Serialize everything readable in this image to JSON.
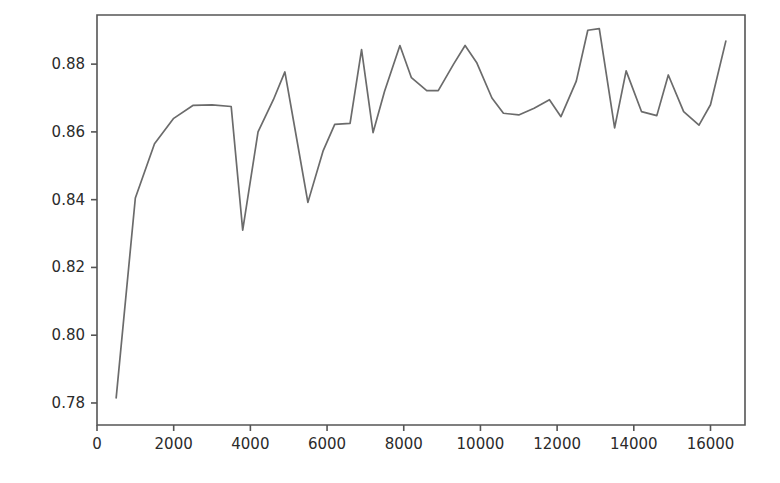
{
  "figure": {
    "background_color": "#ffffff",
    "axes_color": "#555555",
    "tick_label_color": "#2b2b2b"
  },
  "chart_data": {
    "type": "line",
    "title": "",
    "subtitle": "",
    "xlabel": "",
    "ylabel": "",
    "grid": false,
    "legend": false,
    "legend_position": "none",
    "line_color": "#6b6b6b",
    "line_width": 1.7,
    "marker": "none",
    "xlim": [
      0,
      16900
    ],
    "ylim": [
      0.7735,
      0.8945
    ],
    "xticks": [
      0,
      2000,
      4000,
      6000,
      8000,
      10000,
      12000,
      14000,
      16000
    ],
    "xticklabels": [
      "0",
      "2000",
      "4000",
      "6000",
      "8000",
      "10000",
      "12000",
      "14000",
      "16000"
    ],
    "yticks": [
      0.78,
      0.8,
      0.82,
      0.84,
      0.86,
      0.88
    ],
    "yticklabels": [
      "0.78",
      "0.80",
      "0.82",
      "0.84",
      "0.86",
      "0.88"
    ],
    "x": [
      500,
      1000,
      1500,
      2000,
      2500,
      3000,
      3500,
      3800,
      4200,
      4600,
      4900,
      5200,
      5500,
      5900,
      6200,
      6600,
      6900,
      7200,
      7500,
      7900,
      8200,
      8600,
      8900,
      9300,
      9600,
      9900,
      10300,
      10600,
      11000,
      11400,
      11800,
      12100,
      12500,
      12800,
      13100,
      13500,
      13800,
      14200,
      14600,
      14900,
      15300,
      15700,
      16000,
      16400
    ],
    "y": [
      0.7815,
      0.8405,
      0.8565,
      0.864,
      0.8678,
      0.868,
      0.8675,
      0.831,
      0.86,
      0.8695,
      0.8777,
      0.8585,
      0.8392,
      0.8545,
      0.8622,
      0.8625,
      0.8843,
      0.8598,
      0.872,
      0.8855,
      0.876,
      0.8722,
      0.8722,
      0.88,
      0.8855,
      0.8805,
      0.87,
      0.8655,
      0.865,
      0.867,
      0.8695,
      0.8645,
      0.875,
      0.89,
      0.8905,
      0.8612,
      0.878,
      0.866,
      0.8648,
      0.8768,
      0.866,
      0.862,
      0.868,
      0.8868
    ]
  }
}
